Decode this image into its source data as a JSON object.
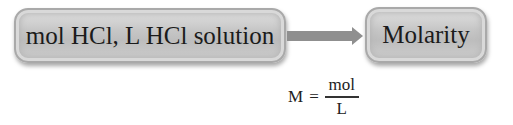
{
  "diagram": {
    "source_box": {
      "label": "mol HCl, L HCl solution"
    },
    "target_box": {
      "label": "Molarity"
    },
    "arrow": {
      "direction": "right",
      "color": "#8f8f8f"
    },
    "formula": {
      "lhs": "M",
      "equals": "=",
      "numerator": "mol",
      "denominator": "L"
    },
    "colors": {
      "box_fill": "#c6c6c6",
      "box_border": "#a9a9a9",
      "text": "#1b1b1b"
    }
  }
}
